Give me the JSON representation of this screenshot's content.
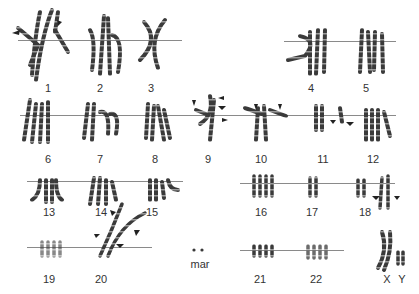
{
  "figure": {
    "type": "karyotype",
    "background": "#ffffff",
    "chromosome_color": "#3a3a3a",
    "line_color": "#8a8a8a"
  },
  "labels": {
    "c1": "1",
    "c2": "2",
    "c3": "3",
    "c4": "4",
    "c5": "5",
    "c6": "6",
    "c7": "7",
    "c8": "8",
    "c9": "9",
    "c10": "10",
    "c11": "11",
    "c12": "12",
    "c13": "13",
    "c14": "14",
    "c15": "15",
    "c16": "16",
    "c17": "17",
    "c18": "18",
    "c19": "19",
    "c20": "20",
    "mar": "mar",
    "c21": "21",
    "c22": "22",
    "cX": "X",
    "cY": "Y"
  },
  "annotations": {
    "arrowheads_present_on": [
      "1",
      "9",
      "10",
      "11",
      "18",
      "20"
    ]
  }
}
